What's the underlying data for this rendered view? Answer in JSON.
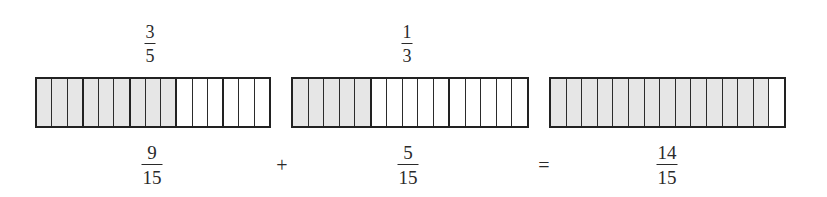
{
  "colors": {
    "shaded": "#e6e6e6",
    "unshaded": "#ffffff",
    "stroke": "#222222",
    "text": "#2a2a2a"
  },
  "top_labels": [
    {
      "numerator": "3",
      "denominator": "5"
    },
    {
      "numerator": "1",
      "denominator": "3"
    }
  ],
  "bars": [
    {
      "total_cells": 15,
      "shaded_cells": 9,
      "group_size": 3,
      "represents": "3/5 = 9/15"
    },
    {
      "total_cells": 15,
      "shaded_cells": 5,
      "group_size": 5,
      "represents": "1/3 = 5/15"
    },
    {
      "total_cells": 15,
      "shaded_cells": 14,
      "group_size": 1,
      "represents": "14/15"
    }
  ],
  "equation": {
    "term1": {
      "numerator": "9",
      "denominator": "15"
    },
    "op1": "+",
    "term2": {
      "numerator": "5",
      "denominator": "15"
    },
    "op2": "=",
    "result": {
      "numerator": "14",
      "denominator": "15"
    }
  }
}
